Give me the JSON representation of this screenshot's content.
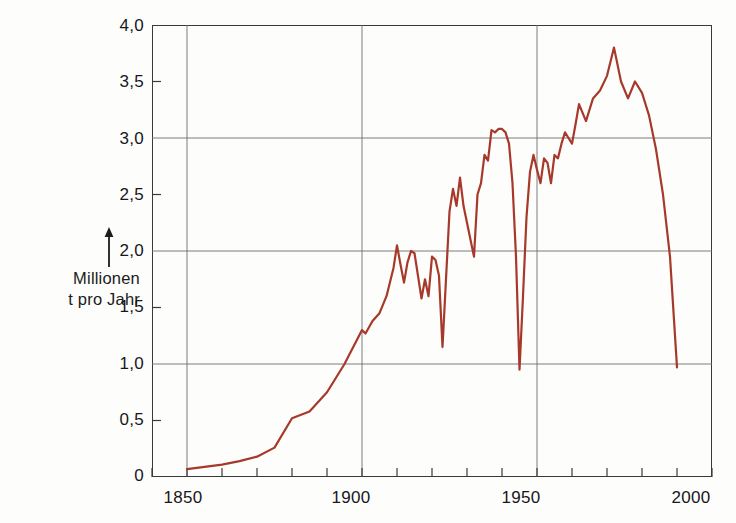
{
  "axes": {
    "y_title_lines": [
      "Millionen",
      "t pro Jahr"
    ],
    "y_arrow_icon": "up-arrow-icon",
    "y_ticks": [
      "4,0",
      "3,5",
      "3,0",
      "2,5",
      "2,0",
      "1,5",
      "1,0",
      "0,5",
      "0"
    ],
    "x_ticks": [
      "1850",
      "1900",
      "1950",
      "2000"
    ]
  },
  "style": {
    "line_color": "#a6392a",
    "grid_color": "#6d6d72",
    "frame_color": "#3a3a3a",
    "background": "#fdfdfc",
    "text_color": "#17171b"
  },
  "chart_data": {
    "type": "line",
    "title": "",
    "subtitle": "",
    "xlabel": "",
    "ylabel": "Millionen t pro Jahr",
    "xlim": [
      1840,
      2000
    ],
    "ylim": [
      0,
      4.0
    ],
    "grid": true,
    "legend": null,
    "y_major_gridlines": [
      1.0,
      2.0,
      3.0,
      4.0
    ],
    "x_major_gridlines": [
      1850,
      1900,
      1950,
      2000
    ],
    "x_minor_tick_step": 10,
    "y_minor_tick_values": [
      0.5,
      1.5,
      2.5,
      3.5
    ],
    "series": [
      {
        "name": "Millionen t pro Jahr",
        "color": "#a6392a",
        "x": [
          1850,
          1855,
          1860,
          1865,
          1870,
          1875,
          1880,
          1885,
          1890,
          1895,
          1900,
          1901,
          1903,
          1905,
          1907,
          1909,
          1910,
          1911,
          1912,
          1913,
          1914,
          1915,
          1916,
          1917,
          1918,
          1919,
          1920,
          1921,
          1922,
          1923,
          1924,
          1925,
          1926,
          1927,
          1928,
          1929,
          1930,
          1931,
          1932,
          1933,
          1934,
          1935,
          1936,
          1937,
          1938,
          1939,
          1940,
          1941,
          1942,
          1943,
          1944,
          1945,
          1946,
          1947,
          1948,
          1949,
          1950,
          1951,
          1952,
          1953,
          1954,
          1955,
          1956,
          1957,
          1958,
          1959,
          1960,
          1961,
          1962,
          1964,
          1966,
          1968,
          1970,
          1972,
          1974,
          1976,
          1978,
          1980,
          1982,
          1984,
          1986,
          1988,
          1990
        ],
        "y": [
          0.07,
          0.09,
          0.11,
          0.14,
          0.18,
          0.26,
          0.52,
          0.58,
          0.75,
          1.0,
          1.3,
          1.27,
          1.38,
          1.45,
          1.6,
          1.85,
          2.05,
          1.88,
          1.72,
          1.9,
          2.0,
          1.98,
          1.78,
          1.58,
          1.75,
          1.6,
          1.95,
          1.92,
          1.78,
          1.15,
          1.75,
          2.35,
          2.55,
          2.4,
          2.65,
          2.4,
          2.25,
          2.1,
          1.95,
          2.5,
          2.6,
          2.85,
          2.8,
          3.07,
          3.05,
          3.08,
          3.08,
          3.05,
          2.95,
          2.6,
          1.95,
          0.95,
          1.6,
          2.3,
          2.7,
          2.85,
          2.72,
          2.6,
          2.82,
          2.78,
          2.6,
          2.85,
          2.82,
          2.95,
          3.05,
          3.0,
          2.95,
          3.12,
          3.3,
          3.15,
          3.35,
          3.42,
          3.55,
          3.8,
          3.5,
          3.35,
          3.5,
          3.4,
          3.2,
          2.9,
          2.5,
          1.95,
          0.97
        ]
      }
    ]
  }
}
